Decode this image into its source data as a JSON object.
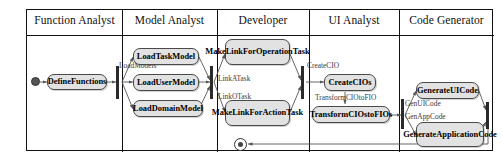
{
  "diagram": {
    "type": "uml-activity-swimlane",
    "title": "",
    "lanes": [
      {
        "id": "function-analyst",
        "label": "Function Analyst"
      },
      {
        "id": "model-analyst",
        "label": "Model Analyst"
      },
      {
        "id": "developer",
        "label": "Developer"
      },
      {
        "id": "ui-analyst",
        "label": "UI Analyst"
      },
      {
        "id": "code-generator",
        "label": "Code Generator"
      }
    ],
    "activities": [
      {
        "id": "define-functions",
        "lane": "function-analyst",
        "label": "DefineFunctions"
      },
      {
        "id": "load-task-model",
        "lane": "model-analyst",
        "label": "LoadTaskModel"
      },
      {
        "id": "load-user-model",
        "lane": "model-analyst",
        "label": "LoadUserModel"
      },
      {
        "id": "load-domain-model",
        "lane": "model-analyst",
        "label": "LoadDomainModel"
      },
      {
        "id": "make-link-for-operation-task",
        "lane": "developer",
        "label": "MakeLinkForOperationTask"
      },
      {
        "id": "make-link-for-action-task",
        "lane": "developer",
        "label": "MakeLinkForActionTask"
      },
      {
        "id": "create-cios",
        "lane": "ui-analyst",
        "label": "CreateCIOs"
      },
      {
        "id": "transform-cios-to-fios",
        "lane": "ui-analyst",
        "label": "TransformCIOstoFIOs"
      },
      {
        "id": "generate-ui-code",
        "lane": "code-generator",
        "label": "GenerateUICode"
      },
      {
        "id": "generate-application-code",
        "lane": "code-generator",
        "label": "GenerateApplicationCode"
      }
    ],
    "edge_labels": [
      {
        "id": "load-models",
        "label": "LoadModels"
      },
      {
        "id": "link-a-task",
        "label": "LinkATask"
      },
      {
        "id": "link-o-task",
        "label": "LinkOTask"
      },
      {
        "id": "create-cio",
        "label": "CreateCIO"
      },
      {
        "id": "transform-cio-to-fio",
        "label": "TransformCIOtoFIO"
      },
      {
        "id": "gen-ui-code",
        "label": "GenUICode"
      },
      {
        "id": "gen-app-code",
        "label": "GenAppCode"
      }
    ],
    "nodes": [
      {
        "id": "initial-node",
        "kind": "initial"
      },
      {
        "id": "final-node",
        "kind": "final"
      }
    ],
    "colors": {
      "activity_fill": "#e2e2e2",
      "activity_stroke": "#4a4a4a",
      "frame_stroke": "#111111",
      "edge_stroke": "#555555",
      "label_text": "#3a3a3a"
    }
  }
}
